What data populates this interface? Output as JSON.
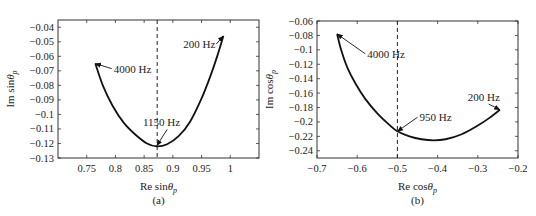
{
  "chart_data": [
    {
      "type": "line",
      "panel_label": "(a)",
      "xlabel": "Re sinθ",
      "xlabel_sub": "p",
      "ylabel": "Im sinθ",
      "ylabel_sub": "p",
      "xlim": [
        0.7,
        1.05
      ],
      "ylim": [
        -0.13,
        -0.035
      ],
      "xticks": [
        0.75,
        0.8,
        0.85,
        0.9,
        0.95,
        1
      ],
      "xtick_labels": [
        "0.75",
        "0.8",
        "0.85",
        "0.9",
        "0.95",
        "1"
      ],
      "yticks": [
        -0.04,
        -0.05,
        -0.06,
        -0.07,
        -0.08,
        -0.09,
        -0.1,
        -0.11,
        -0.12,
        -0.13
      ],
      "ytick_labels": [
        "−0.04",
        "−0.05",
        "−0.06",
        "−0.07",
        "−0.08",
        "−0.09",
        "−0.1",
        "−0.11",
        "−0.12",
        "−0.13"
      ],
      "grid": false,
      "vline": {
        "x": 0.8727,
        "style": "dashed"
      },
      "series": [
        {
          "name": "200–4000 Hz",
          "x": [
            0.765,
            0.778,
            0.795,
            0.815,
            0.835,
            0.855,
            0.872,
            0.89,
            0.91,
            0.93,
            0.95,
            0.965,
            0.978,
            0.988
          ],
          "y": [
            -0.065,
            -0.08,
            -0.094,
            -0.106,
            -0.114,
            -0.12,
            -0.122,
            -0.1205,
            -0.115,
            -0.105,
            -0.089,
            -0.074,
            -0.059,
            -0.046
          ]
        }
      ],
      "annotations": [
        {
          "text": "4000 Hz",
          "xy": [
            0.765,
            -0.065
          ],
          "text_xy": [
            0.797,
            -0.0685
          ]
        },
        {
          "text": "1150 Hz",
          "xy": [
            0.872,
            -0.1215
          ],
          "text_xy": [
            0.848,
            -0.1055
          ]
        },
        {
          "text": "200 Hz",
          "xy": [
            0.988,
            -0.046
          ],
          "text_xy": [
            0.918,
            -0.0515
          ]
        }
      ]
    },
    {
      "type": "line",
      "panel_label": "(b)",
      "xlabel": "Re cosθ",
      "xlabel_sub": "p",
      "ylabel": "Im cosθ",
      "ylabel_sub": "p",
      "xlim": [
        -0.7,
        -0.2
      ],
      "ylim": [
        -0.25,
        -0.06
      ],
      "xticks": [
        -0.7,
        -0.6,
        -0.5,
        -0.4,
        -0.3,
        -0.2
      ],
      "xtick_labels": [
        "−0.7",
        "−0.6",
        "−0.5",
        "−0.4",
        "−0.3",
        "−0.2"
      ],
      "yticks": [
        -0.06,
        -0.08,
        -0.1,
        -0.12,
        -0.14,
        -0.16,
        -0.18,
        -0.2,
        -0.22,
        -0.24
      ],
      "ytick_labels": [
        "−0.06",
        "−0.08",
        "−0.1",
        "−0.12",
        "−0.14",
        "−0.16",
        "−0.18",
        "−0.2",
        "−0.22",
        "−0.24"
      ],
      "grid": false,
      "vline": {
        "x": -0.5,
        "style": "dashed"
      },
      "series": [
        {
          "name": "200–4000 Hz",
          "x": [
            -0.65,
            -0.64,
            -0.625,
            -0.605,
            -0.58,
            -0.55,
            -0.52,
            -0.5,
            -0.47,
            -0.44,
            -0.41,
            -0.38,
            -0.34,
            -0.3,
            -0.27,
            -0.245
          ],
          "y": [
            -0.078,
            -0.1,
            -0.124,
            -0.146,
            -0.168,
            -0.188,
            -0.204,
            -0.213,
            -0.22,
            -0.224,
            -0.2255,
            -0.224,
            -0.217,
            -0.205,
            -0.194,
            -0.183
          ]
        }
      ],
      "annotations": [
        {
          "text": "4000 Hz",
          "xy": [
            -0.65,
            -0.078
          ],
          "text_xy": [
            -0.575,
            -0.1055
          ]
        },
        {
          "text": "950 Hz",
          "xy": [
            -0.5,
            -0.213
          ],
          "text_xy": [
            -0.445,
            -0.1935
          ]
        },
        {
          "text": "200 Hz",
          "xy": [
            -0.245,
            -0.183
          ],
          "text_xy": [
            -0.325,
            -0.1655
          ]
        }
      ]
    }
  ],
  "layout": {
    "panels": [
      {
        "left": 58,
        "top": 20,
        "right": 259,
        "bottom": 158
      },
      {
        "left": 317,
        "top": 21,
        "right": 518,
        "bottom": 158
      }
    ]
  },
  "colors": {
    "line": "#111111",
    "axes": "#333333",
    "text": "#222222"
  }
}
